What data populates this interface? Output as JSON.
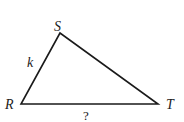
{
  "diagram": {
    "type": "triangle",
    "vertices": {
      "S": {
        "label": "S",
        "x": 60,
        "y": 33
      },
      "R": {
        "label": "R",
        "x": 21,
        "y": 104
      },
      "T": {
        "label": "T",
        "x": 158,
        "y": 104
      }
    },
    "sides": {
      "RS": {
        "label": "k"
      },
      "RT": {
        "label": "?"
      },
      "ST": {
        "label": ""
      }
    },
    "stroke_color": "#1a1a1a",
    "label_color": "#222222"
  }
}
